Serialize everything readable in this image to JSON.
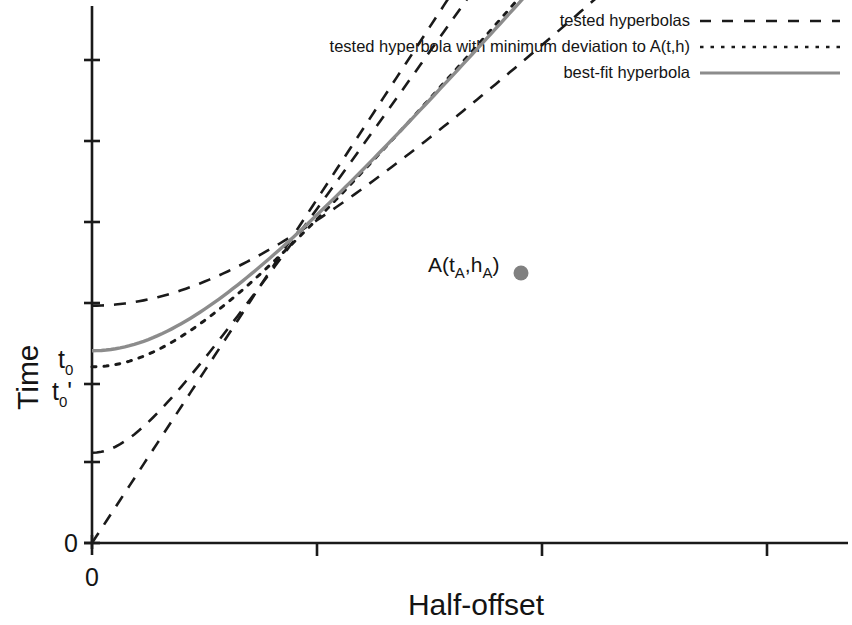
{
  "chart_data": {
    "type": "line",
    "title": "",
    "xlabel": "Half-offset",
    "ylabel": "Time",
    "grid": false,
    "legend_position": "top-right",
    "x_axis": {
      "label": "Half-offset",
      "origin_tick_label": "0",
      "tick_labels": [
        "0",
        "",
        "",
        "",
        ""
      ],
      "range": [
        0,
        1
      ]
    },
    "y_axis": {
      "label": "Time",
      "tick_labels": [
        "0",
        "t0'",
        "t0"
      ],
      "zero_label": "0",
      "t0_label": "t",
      "t0_sub": "0",
      "t0_prime_label": "t",
      "t0_prime_sub": "0",
      "t0_prime_mark": "'",
      "range": [
        0,
        1
      ]
    },
    "annotations": [
      {
        "name": "point-A",
        "label_main": "A(t",
        "label_sub1": "A",
        "label_mid": ",h",
        "label_sub2": "A",
        "label_end": ")",
        "x": 0.635,
        "y": 0.595,
        "marker_color": "#808080"
      }
    ],
    "series": [
      {
        "name": "tested hyperbola upper",
        "style": "dashed",
        "color": "#1a1a1a",
        "t0": 0.442,
        "v": 0.735,
        "legend_ref": 0
      },
      {
        "name": "best-fit hyperbola",
        "style": "solid",
        "color": "#8c8c8c",
        "t0": 0.358,
        "v": 0.605,
        "legend_ref": 2
      },
      {
        "name": "tested hyperbola with minimum deviation",
        "style": "dotted",
        "color": "#1a1a1a",
        "t0": 0.328,
        "v": 0.592,
        "legend_ref": 1
      },
      {
        "name": "tested hyperbola middle-lower",
        "style": "dashed",
        "color": "#1a1a1a",
        "t0": 0.168,
        "v": 0.5,
        "legend_ref": 0
      },
      {
        "name": "tested hyperbola lowest",
        "style": "dashed",
        "color": "#1a1a1a",
        "t0": 0.0,
        "v": 0.468,
        "legend_ref": 0
      }
    ],
    "legend": [
      {
        "label": "tested hyperbolas",
        "style": "dashed",
        "color": "#1a1a1a"
      },
      {
        "label": "tested hyperbola with minimum deviation to A(t,h)",
        "style": "dotted",
        "color": "#1a1a1a"
      },
      {
        "label": "best-fit hyperbola",
        "style": "solid",
        "color": "#8c8c8c"
      }
    ]
  },
  "colors": {
    "axis": "#1a1a1a",
    "dash_curve": "#1a1a1a",
    "best_fit": "#8c8c8c",
    "marker": "#808080",
    "background": "#ffffff"
  }
}
